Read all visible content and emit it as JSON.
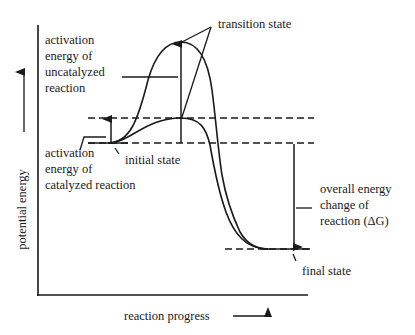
{
  "diagram": {
    "type": "energy-profile",
    "title": "",
    "axes": {
      "y_label": "potential energy",
      "x_label": "reaction progress"
    },
    "labels": {
      "transition_state": "transition state",
      "activation_uncatalyzed": [
        "activation",
        "energy of",
        "uncatalyzed",
        "reaction"
      ],
      "activation_catalyzed": [
        "activation",
        "energy of",
        "catalyzed reaction"
      ],
      "initial_state": "initial state",
      "overall_change": [
        "overall energy",
        "change of",
        "reaction (ΔG)"
      ],
      "final_state": "final state"
    },
    "curves": [
      {
        "name": "uncatalyzed",
        "start_level": "initial state",
        "peak": "high transition state",
        "end_level": "final state"
      },
      {
        "name": "catalyzed",
        "start_level": "initial state",
        "peak": "low transition state",
        "end_level": "final state"
      }
    ],
    "colors": {
      "ink": "#1a1a1a",
      "background": "#ffffff"
    }
  }
}
